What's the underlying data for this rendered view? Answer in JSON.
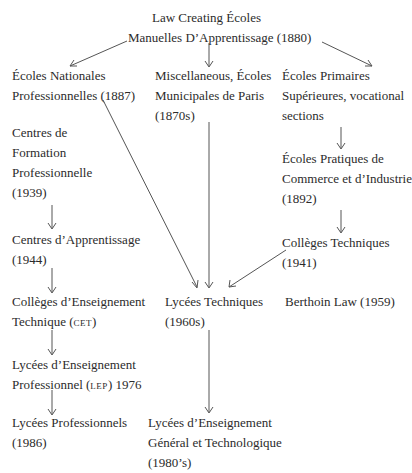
{
  "diagram": {
    "type": "flowchart",
    "nodes": {
      "law_1880": {
        "lines": [
          "Law Creating Écoles",
          "Manuelles D’Apprentissage (1880)"
        ]
      },
      "ecoles_nationales": {
        "lines": [
          "Écoles Nationales",
          "Professionnelles (1887)"
        ]
      },
      "miscellaneous": {
        "lines": [
          "Miscellaneous, Écoles",
          "Municipales de Paris",
          "(1870s)"
        ]
      },
      "ecoles_primaires": {
        "lines": [
          "Écoles Primaires",
          "Supérieures, vocational",
          "sections"
        ]
      },
      "ecoles_pratiques": {
        "lines": [
          "Écoles Pratiques de",
          "Commerce et d’Industrie",
          "(1892)"
        ]
      },
      "colleges_techniques": {
        "lines": [
          "Collèges Techniques",
          "(1941)"
        ]
      },
      "centres_formation": {
        "lines": [
          "Centres de",
          "Formation",
          "Professionnelle",
          "(1939)"
        ]
      },
      "centres_apprentissage": {
        "lines": [
          "Centres d’Apprentissage",
          "(1944)"
        ]
      },
      "colleges_enseignement": {
        "lines": [
          "Collèges d’Enseignement",
          "Technique (",
          "cet",
          ")"
        ]
      },
      "lycees_techniques": {
        "lines": [
          "Lycées Techniques",
          "(1960s)"
        ]
      },
      "berthoin_law": {
        "lines": [
          "Berthoin Law (1959)"
        ]
      },
      "lycees_ens_prof": {
        "lines": [
          "Lycées d’Enseignement",
          "Professionnel (",
          "lep",
          ") 1976"
        ]
      },
      "lycees_professionnels": {
        "lines": [
          "Lycées Professionnels",
          "(1986)"
        ]
      },
      "lycees_ens_general": {
        "lines": [
          "Lycées d’Enseignement",
          "Général et Technologique",
          "(1980’s)"
        ]
      }
    },
    "edges": [
      {
        "from": "law_1880",
        "to": "ecoles_nationales"
      },
      {
        "from": "law_1880",
        "to": "miscellaneous"
      },
      {
        "from": "law_1880",
        "to": "ecoles_primaires"
      },
      {
        "from": "ecoles_primaires",
        "to": "ecoles_pratiques"
      },
      {
        "from": "ecoles_pratiques",
        "to": "colleges_techniques"
      },
      {
        "from": "centres_formation",
        "to": "centres_apprentissage"
      },
      {
        "from": "centres_apprentissage",
        "to": "colleges_enseignement"
      },
      {
        "from": "colleges_enseignement",
        "to": "lycees_ens_prof"
      },
      {
        "from": "lycees_ens_prof",
        "to": "lycees_professionnels"
      },
      {
        "from": "ecoles_nationales",
        "to": "lycees_techniques"
      },
      {
        "from": "miscellaneous",
        "to": "lycees_techniques"
      },
      {
        "from": "colleges_techniques",
        "to": "lycees_techniques"
      },
      {
        "from": "lycees_techniques",
        "to": "lycees_ens_general"
      }
    ]
  }
}
